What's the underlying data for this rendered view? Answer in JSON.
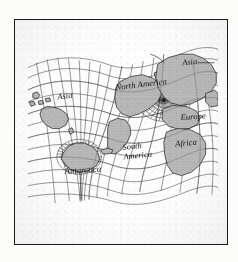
{
  "figure": {
    "kind": "world-map",
    "projection_type": "oblique azimuthal graticule",
    "border_color": "#1b1b1b",
    "land_fill": "#b9b9b9",
    "land_stroke": "#141414",
    "graticule_color": "#2a2a2a",
    "paper_color": "#fefefe"
  },
  "labels": [
    {
      "id": "asia-west",
      "text": "Asia",
      "x": 48,
      "y": 93,
      "size": 9.5,
      "rotate": -8,
      "leader": false
    },
    {
      "id": "north-america",
      "text": "North America",
      "x": 113,
      "y": 82,
      "size": 9.8,
      "rotate": -7,
      "leader": false
    },
    {
      "id": "asia-east",
      "text": "Asia",
      "x": 188,
      "y": 53,
      "size": 9.5,
      "rotate": -6,
      "leader": true
    },
    {
      "id": "europe",
      "text": "Europe",
      "x": 186,
      "y": 117,
      "size": 9.8,
      "rotate": -4,
      "leader": false
    },
    {
      "id": "africa",
      "text": "Africa",
      "x": 180,
      "y": 148,
      "size": 9.8,
      "rotate": -5,
      "leader": false
    },
    {
      "id": "south-america-1",
      "text": "South",
      "x": 121,
      "y": 152,
      "size": 9.5,
      "rotate": -6,
      "leader": false
    },
    {
      "id": "south-america-2",
      "text": "America",
      "x": 122,
      "y": 163,
      "size": 9.5,
      "rotate": -6,
      "leader": false
    },
    {
      "id": "antarctica",
      "text": "Antarctica",
      "x": 56,
      "y": 180,
      "size": 9.8,
      "rotate": -4,
      "leader": false
    }
  ],
  "poles": [
    {
      "id": "south-pole",
      "label": "Antarctica",
      "cx": 72,
      "cy": 160,
      "rays": 36,
      "ray_len": 26
    },
    {
      "id": "north-pole",
      "label": "Arctic",
      "cx": 167,
      "cy": 94,
      "rays": 36,
      "ray_len": 30
    }
  ]
}
